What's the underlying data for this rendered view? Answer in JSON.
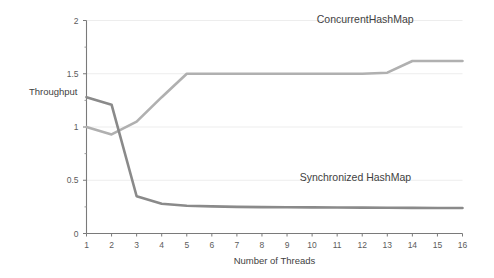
{
  "chart_data": {
    "type": "line",
    "title": "",
    "xlabel": "Number of Threads",
    "ylabel": "Throughput",
    "xlim": [
      1,
      16
    ],
    "ylim": [
      0,
      2
    ],
    "grid": true,
    "grid_axis": "y",
    "legend_position": "inline-annotation",
    "x": [
      1,
      2,
      3,
      4,
      5,
      6,
      7,
      8,
      9,
      10,
      11,
      12,
      13,
      14,
      15,
      16
    ],
    "xticks": [
      "1",
      "2",
      "3",
      "4",
      "5",
      "6",
      "7",
      "8",
      "9",
      "10",
      "11",
      "12",
      "13",
      "14",
      "15",
      "16"
    ],
    "yticks": [
      "0",
      "0.5",
      "1",
      "1.5",
      "2"
    ],
    "ytick_values": [
      0,
      0.5,
      1,
      1.5,
      2
    ],
    "yminor_values": [
      0.25,
      0.75,
      1.25,
      1.75
    ],
    "series": [
      {
        "name": "ConcurrentHashMap",
        "color": "#b0b0b0",
        "label_x": 14.05,
        "label_y": 1.98,
        "values": [
          1.0,
          0.93,
          1.05,
          1.28,
          1.5,
          1.5,
          1.5,
          1.5,
          1.5,
          1.5,
          1.5,
          1.5,
          1.51,
          1.62,
          1.62,
          1.62
        ]
      },
      {
        "name": "Synchronized HashMap",
        "color": "#8a8a8a",
        "label_x": 13.95,
        "label_y": 0.49,
        "values": [
          1.28,
          1.21,
          0.35,
          0.28,
          0.26,
          0.255,
          0.25,
          0.248,
          0.246,
          0.245,
          0.244,
          0.243,
          0.242,
          0.241,
          0.24,
          0.24
        ]
      }
    ]
  },
  "axes": {
    "y_axis_title": "Throughput",
    "x_axis_title": "Number of Threads"
  }
}
